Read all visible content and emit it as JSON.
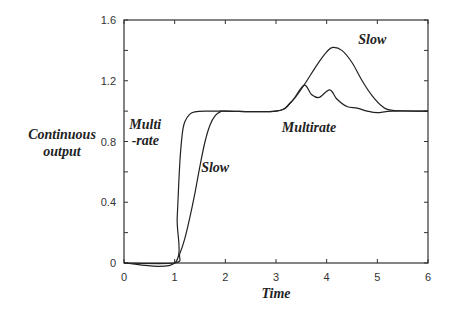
{
  "chart_data": {
    "type": "line",
    "title": "",
    "xlabel": "Time",
    "ylabel": "Continuous output",
    "xlim": [
      0,
      6
    ],
    "ylim": [
      0,
      1.6
    ],
    "xticks": [
      "0",
      "1",
      "2",
      "3",
      "4",
      "5",
      "6"
    ],
    "yticks": [
      "0",
      "0.4",
      "0.8",
      "1.2",
      "1.6"
    ],
    "grid": false,
    "series": [
      {
        "name": "Multirate",
        "x": [
          0,
          1.0,
          1.05,
          1.1,
          1.15,
          1.2,
          1.3,
          1.4,
          1.6,
          2.0,
          3.0,
          3.3,
          3.55,
          3.7,
          3.85,
          4.06,
          4.2,
          4.4,
          4.6,
          4.8,
          5.0,
          5.3,
          6.0
        ],
        "values": [
          0,
          0,
          0.3,
          0.65,
          0.85,
          0.93,
          0.98,
          0.995,
          1.0,
          1.0,
          1.0,
          1.06,
          1.17,
          1.11,
          1.09,
          1.14,
          1.08,
          1.03,
          1.02,
          1.0,
          0.99,
          1.0,
          1.0
        ]
      },
      {
        "name": "Slow",
        "x": [
          0,
          1.0,
          1.1,
          1.2,
          1.3,
          1.4,
          1.5,
          1.6,
          1.7,
          1.8,
          1.9,
          2.0,
          3.0,
          3.3,
          3.55,
          3.8,
          4.0,
          4.12,
          4.3,
          4.5,
          4.7,
          4.9,
          5.1,
          5.3,
          6.0
        ],
        "values": [
          0,
          0,
          0.06,
          0.16,
          0.3,
          0.46,
          0.64,
          0.8,
          0.91,
          0.97,
          0.995,
          1.0,
          1.0,
          1.06,
          1.17,
          1.3,
          1.39,
          1.42,
          1.4,
          1.32,
          1.2,
          1.1,
          1.03,
          1.005,
          1.0
        ]
      }
    ],
    "annotations": [
      {
        "text": "Multi",
        "x": 0.42,
        "y": 0.88
      },
      {
        "text": "-rate",
        "x": 0.42,
        "y": 0.78
      },
      {
        "text": "Slow",
        "x": 1.8,
        "y": 0.6
      },
      {
        "text": "Slow",
        "x": 4.9,
        "y": 1.44
      },
      {
        "text": "Multirate",
        "x": 3.65,
        "y": 0.86
      }
    ]
  }
}
